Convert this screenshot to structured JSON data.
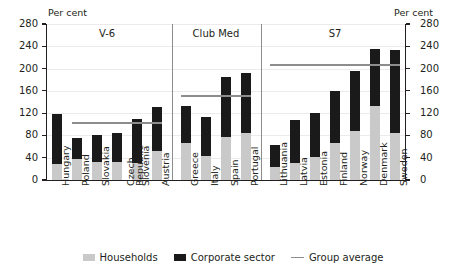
{
  "axis": {
    "unit_label_left": "Per cent",
    "unit_label_right": "Per cent",
    "ticks": [
      0,
      40,
      80,
      120,
      160,
      200,
      240,
      280
    ],
    "min": 0,
    "max": 280
  },
  "legend": {
    "items": [
      {
        "label": "Households",
        "type": "box",
        "color": "#c9c9c9"
      },
      {
        "label": "Corporate sector",
        "type": "box",
        "color": "#1a1a1a"
      },
      {
        "label": "Group average",
        "type": "line",
        "color": "#8d8d8d"
      }
    ]
  },
  "groups": [
    {
      "label": "V-6",
      "average": 104,
      "count": 6
    },
    {
      "label": "Club Med",
      "average": 152,
      "count": 4
    },
    {
      "label": "S7",
      "average": 208,
      "count": 7
    }
  ],
  "chart_data": {
    "type": "bar",
    "stacked": true,
    "title": "",
    "xlabel": "",
    "ylabel": "Per cent",
    "ylim": [
      0,
      280
    ],
    "yticks": [
      0,
      40,
      80,
      120,
      160,
      200,
      240,
      280
    ],
    "grid": true,
    "legend_position": "bottom",
    "categories": [
      "Hungary",
      "Poland",
      "Slovakia",
      "Czech Republic",
      "Slovenia",
      "Austria",
      "Greece",
      "Italy",
      "Spain",
      "Portugal",
      "Lithuania",
      "Latvia",
      "Estonia",
      "Finland",
      "Norway",
      "Denmark",
      "Sweden"
    ],
    "groups": [
      "V-6",
      "V-6",
      "V-6",
      "V-6",
      "V-6",
      "V-6",
      "Club Med",
      "Club Med",
      "Club Med",
      "Club Med",
      "S7",
      "S7",
      "S7",
      "S7",
      "S7",
      "S7",
      "S7"
    ],
    "series": [
      {
        "name": "Households",
        "color": "#c9c9c9",
        "values": [
          28,
          38,
          33,
          33,
          31,
          52,
          66,
          43,
          78,
          84,
          24,
          30,
          42,
          66,
          88,
          132,
          85
        ]
      },
      {
        "name": "Corporate sector",
        "color": "#1a1a1a",
        "values": [
          90,
          37,
          47,
          51,
          78,
          79,
          67,
          70,
          107,
          108,
          38,
          77,
          79,
          93,
          108,
          104,
          148
        ]
      }
    ],
    "totals": [
      118,
      75,
      80,
      84,
      109,
      131,
      133,
      113,
      185,
      192,
      62,
      107,
      121,
      159,
      196,
      236,
      233
    ],
    "group_average": [
      {
        "name": "V-6",
        "value": 104,
        "spans": [
          "Poland",
          "Austria"
        ]
      },
      {
        "name": "Club Med",
        "value": 152,
        "spans": [
          "Greece",
          "Portugal"
        ]
      },
      {
        "name": "S7",
        "value": 208,
        "spans": [
          "Lithuania",
          "Sweden"
        ]
      }
    ],
    "annotations": [
      "V-6",
      "Club Med",
      "S7"
    ]
  }
}
